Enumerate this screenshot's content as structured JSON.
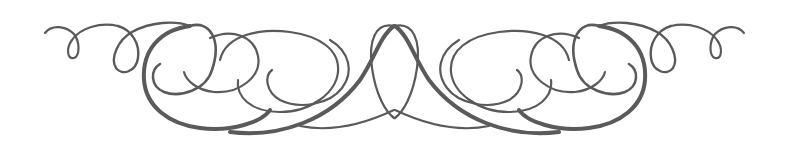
{
  "ornament": {
    "name": "calligraphic-flourish-divider",
    "stroke_color": "#5a5a5a",
    "background": "#ffffff",
    "symmetry": "mirror-horizontal",
    "center_x": 394.5
  }
}
